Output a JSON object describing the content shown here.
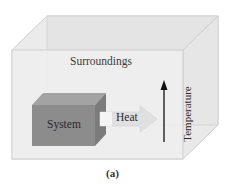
{
  "figure": {
    "caption": "(a)",
    "labels": {
      "surroundings": "Surroundings",
      "system": "System",
      "heat": "Heat",
      "temperature": "Temperature"
    },
    "colors": {
      "background": "#ffffff",
      "surroundings_box_fill": "#e8e8e8",
      "surroundings_box_edge": "#cfcfcf",
      "system_front": "#8c8c8c",
      "system_top": "#a6a6a6",
      "system_side": "#7a7a7a",
      "heat_arrow": "#e2e2e2",
      "temperature_arrow": "#111111"
    }
  }
}
